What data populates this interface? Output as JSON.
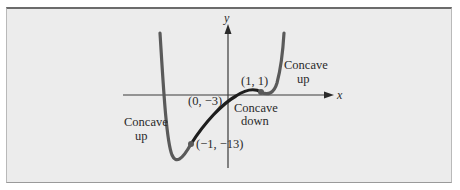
{
  "figure": {
    "axes": {
      "x_label": "x",
      "y_label": "y"
    },
    "points": [
      {
        "label": "(0, −3)",
        "x": 0,
        "y": -3
      },
      {
        "label": "(1, 1)",
        "x": 1,
        "y": 1
      },
      {
        "label": "(−1, −13)",
        "x": -1,
        "y": -13
      }
    ],
    "annotations": {
      "left_region": {
        "line1": "Concave",
        "line2": "up"
      },
      "middle_region": {
        "line1": "Concave",
        "line2": "down"
      },
      "right_region": {
        "line1": "Concave",
        "line2": "up"
      }
    },
    "colors": {
      "curve_outer": "#555555",
      "curve_middle": "#1e1e1e",
      "axis": "#333333",
      "background": "#ececec"
    }
  }
}
